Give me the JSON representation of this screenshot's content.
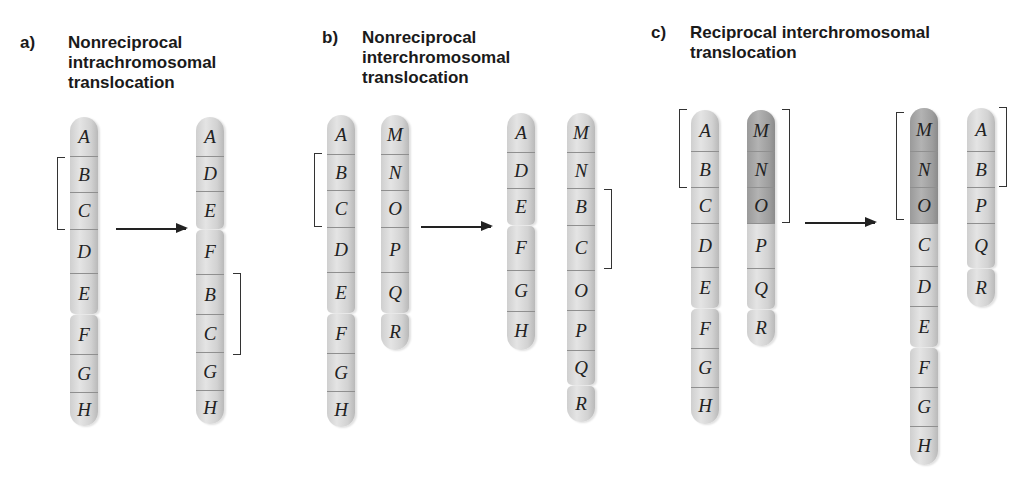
{
  "panels": [
    {
      "label": "a)",
      "title_lines": [
        "Nonreciprocal",
        "intrachromosomal",
        "translocation"
      ],
      "before": [
        {
          "id": "a-before-1",
          "p_arm": [
            "A",
            "B",
            "C",
            "D",
            "E"
          ],
          "q_arm": [
            "F",
            "G",
            "H"
          ],
          "dark": []
        }
      ],
      "after": [
        {
          "id": "a-after-1",
          "p_arm": [
            "A",
            "D",
            "E"
          ],
          "q_arm": [
            "F",
            "B",
            "C",
            "G",
            "H"
          ],
          "dark": []
        }
      ],
      "brackets_before": [
        {
          "spans": "B-C",
          "side": "left"
        }
      ],
      "brackets_after": [
        {
          "spans": "B-C",
          "side": "right"
        }
      ]
    },
    {
      "label": "b)",
      "title_lines": [
        "Nonreciprocal",
        "interchromosomal",
        "translocation"
      ],
      "before": [
        {
          "id": "b-before-1",
          "p_arm": [
            "A",
            "B",
            "C",
            "D",
            "E"
          ],
          "q_arm": [
            "F",
            "G",
            "H"
          ],
          "dark": []
        },
        {
          "id": "b-before-2",
          "p_arm": [
            "M",
            "N",
            "O",
            "P",
            "Q"
          ],
          "q_arm": [
            "R"
          ],
          "dark": []
        }
      ],
      "after": [
        {
          "id": "b-after-1",
          "p_arm": [
            "A",
            "D",
            "E"
          ],
          "q_arm": [
            "F",
            "G",
            "H"
          ],
          "dark": []
        },
        {
          "id": "b-after-2",
          "p_arm": [
            "M",
            "N",
            "B",
            "C",
            "O",
            "P",
            "Q"
          ],
          "q_arm": [
            "R"
          ],
          "dark": []
        }
      ],
      "brackets_before": [
        {
          "spans": "B-C",
          "side": "left"
        }
      ],
      "brackets_after": [
        {
          "spans": "B-C",
          "side": "right"
        }
      ]
    },
    {
      "label": "c)",
      "title_lines": [
        "Reciprocal interchromosomal",
        "translocation"
      ],
      "before": [
        {
          "id": "c-before-1",
          "p_arm": [
            "A",
            "B",
            "C",
            "D",
            "E"
          ],
          "q_arm": [
            "F",
            "G",
            "H"
          ],
          "dark": []
        },
        {
          "id": "c-before-2",
          "p_arm": [
            "M",
            "N",
            "O",
            "P",
            "Q"
          ],
          "q_arm": [
            "R"
          ],
          "dark": [
            "M",
            "N",
            "O"
          ]
        }
      ],
      "after": [
        {
          "id": "c-after-1",
          "p_arm": [
            "M",
            "N",
            "O",
            "C",
            "D",
            "E"
          ],
          "q_arm": [
            "F",
            "G",
            "H"
          ],
          "dark": [
            "M",
            "N",
            "O"
          ]
        },
        {
          "id": "c-after-2",
          "p_arm": [
            "A",
            "B",
            "P",
            "Q"
          ],
          "q_arm": [
            "R"
          ],
          "dark": []
        }
      ],
      "brackets_before": [
        {
          "spans": "A-B",
          "side": "left"
        },
        {
          "spans": "M-O",
          "side": "right"
        }
      ],
      "brackets_after": [
        {
          "spans": "M-O",
          "side": "left"
        },
        {
          "spans": "A-B",
          "side": "right"
        }
      ]
    }
  ],
  "colors": {
    "chromosome_fill": "#d6d6d6",
    "translocated_segment_fill": "#a3a3a3",
    "band_line": "#8f8f8f",
    "text": "#1a1a1a"
  }
}
